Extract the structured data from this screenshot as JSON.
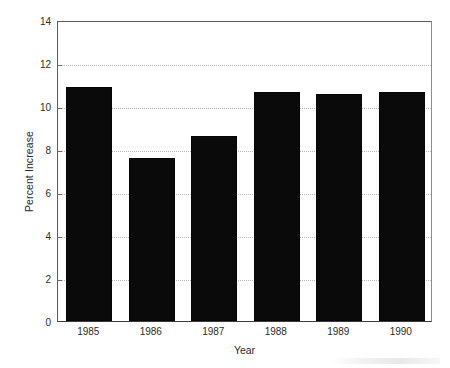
{
  "chart_data": {
    "type": "bar",
    "title": "",
    "subtitle": "",
    "xlabel": "Year",
    "ylabel": "Percent Increase",
    "categories": [
      "1985",
      "1986",
      "1987",
      "1988",
      "1989",
      "1990"
    ],
    "values": [
      10.9,
      7.6,
      8.6,
      10.65,
      10.55,
      10.65
    ],
    "series": [
      {
        "name": "Percent Increase",
        "values": [
          10.9,
          7.6,
          8.6,
          10.65,
          10.55,
          10.65
        ],
        "color": "#0a0a0a"
      }
    ],
    "ylim": [
      0,
      14
    ],
    "xlim": [
      0,
      6
    ],
    "ytick_labels": [
      "0",
      "2",
      "4",
      "6",
      "8",
      "10",
      "12",
      "14"
    ],
    "ytick_values": [
      0,
      2,
      4,
      6,
      8,
      10,
      12,
      14
    ],
    "xtick_labels": [
      "1985",
      "1986",
      "1987",
      "1988",
      "1989",
      "1990"
    ],
    "grid": "horizontal-dotted",
    "legend": "none",
    "bar_color": "#0a0a0a",
    "gridline_color": "#b9b9c4",
    "axis_color": "#5a5a5a",
    "annotations": []
  }
}
